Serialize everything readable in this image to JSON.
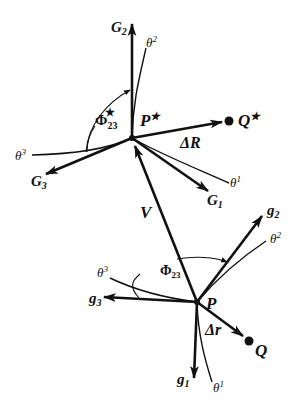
{
  "figure": {
    "points": {
      "P_star": {
        "label": "P",
        "sup": "★"
      },
      "Q_star": {
        "label": "Q",
        "sup": "★"
      },
      "P": {
        "label": "P"
      },
      "Q": {
        "label": "Q"
      }
    },
    "deformed_frame": {
      "G1": {
        "label": "G",
        "sub": "1"
      },
      "G2": {
        "label": "G",
        "sub": "2"
      },
      "G3": {
        "label": "G",
        "sub": "3"
      },
      "theta1": {
        "label": "θ",
        "sup": "1"
      },
      "theta2": {
        "label": "θ",
        "sup": "2"
      },
      "theta3": {
        "label": "θ",
        "sup": "3"
      },
      "angle": {
        "label": "Φ",
        "sub": "23",
        "sup": "★"
      },
      "delta": {
        "label": "ΔR"
      }
    },
    "reference_frame": {
      "g1": {
        "label": "g",
        "sub": "1"
      },
      "g2": {
        "label": "g",
        "sub": "2"
      },
      "g3": {
        "label": "g",
        "sub": "3"
      },
      "theta1": {
        "label": "θ",
        "sup": "1"
      },
      "theta2": {
        "label": "θ",
        "sup": "2"
      },
      "theta3": {
        "label": "θ",
        "sup": "3"
      },
      "angle": {
        "label": "Φ",
        "sub": "23"
      },
      "delta": {
        "label": "Δr"
      }
    },
    "displacement": {
      "label": "V"
    }
  }
}
